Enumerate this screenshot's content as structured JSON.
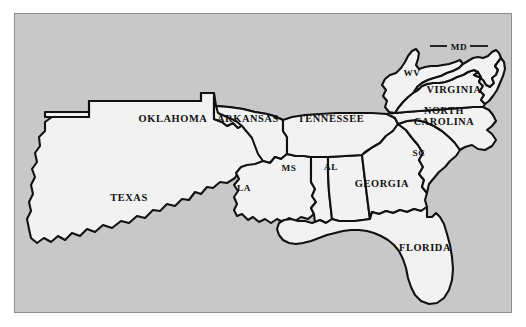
{
  "figure": {
    "kind": "reference-map",
    "background_color": "#c8c8c8",
    "land_fill_color": "#f2f2f2",
    "border_color": "#111111",
    "panel_border_color": "#8e8e8e"
  },
  "map": {
    "states": [
      {
        "id": "texas",
        "label": "TEXAS",
        "label_x": 128,
        "label_y": 196,
        "style": "full"
      },
      {
        "id": "oklahoma",
        "label": "OKLAHOMA",
        "label_x": 172,
        "label_y": 117,
        "style": "full"
      },
      {
        "id": "arkansas",
        "label": "ARKANSAS",
        "label_x": 247,
        "label_y": 117,
        "style": "full"
      },
      {
        "id": "louisiana",
        "label": "LA",
        "label_x": 243,
        "label_y": 186,
        "style": "abbrev"
      },
      {
        "id": "mississippi",
        "label": "MS",
        "label_x": 288,
        "label_y": 166,
        "style": "abbrev"
      },
      {
        "id": "alabama",
        "label": "AL",
        "label_x": 330,
        "label_y": 165,
        "style": "abbrev"
      },
      {
        "id": "tennessee",
        "label": "TENNESSEE",
        "label_x": 330,
        "label_y": 117,
        "style": "full"
      },
      {
        "id": "georgia",
        "label": "GEORGIA",
        "label_x": 381,
        "label_y": 182,
        "style": "full"
      },
      {
        "id": "florida",
        "label": "FLORIDA",
        "label_x": 424,
        "label_y": 246,
        "style": "full"
      },
      {
        "id": "south-carolina",
        "label": "SC",
        "label_x": 418,
        "label_y": 151,
        "style": "abbrev"
      },
      {
        "id": "north-carolina",
        "label_line1": "NORTH",
        "label_line2": "CAROLINA",
        "label_x": 443,
        "label_y": 113,
        "style": "two-line"
      },
      {
        "id": "virginia",
        "label": "VIRGINIA",
        "label_x": 453,
        "label_y": 88,
        "style": "full"
      },
      {
        "id": "west-virginia",
        "label": "WV",
        "label_x": 411,
        "label_y": 71,
        "style": "abbrev"
      },
      {
        "id": "maryland",
        "label": "MD",
        "label_x": 458,
        "label_y": 45,
        "style": "abbrev-leader"
      }
    ],
    "leader_lines": [
      {
        "id": "maryland-leader-left",
        "x1": 429,
        "y1": 45,
        "x2": 447,
        "y2": 45
      },
      {
        "id": "maryland-leader-right",
        "x1": 469,
        "y1": 45,
        "x2": 487,
        "y2": 45
      }
    ]
  }
}
